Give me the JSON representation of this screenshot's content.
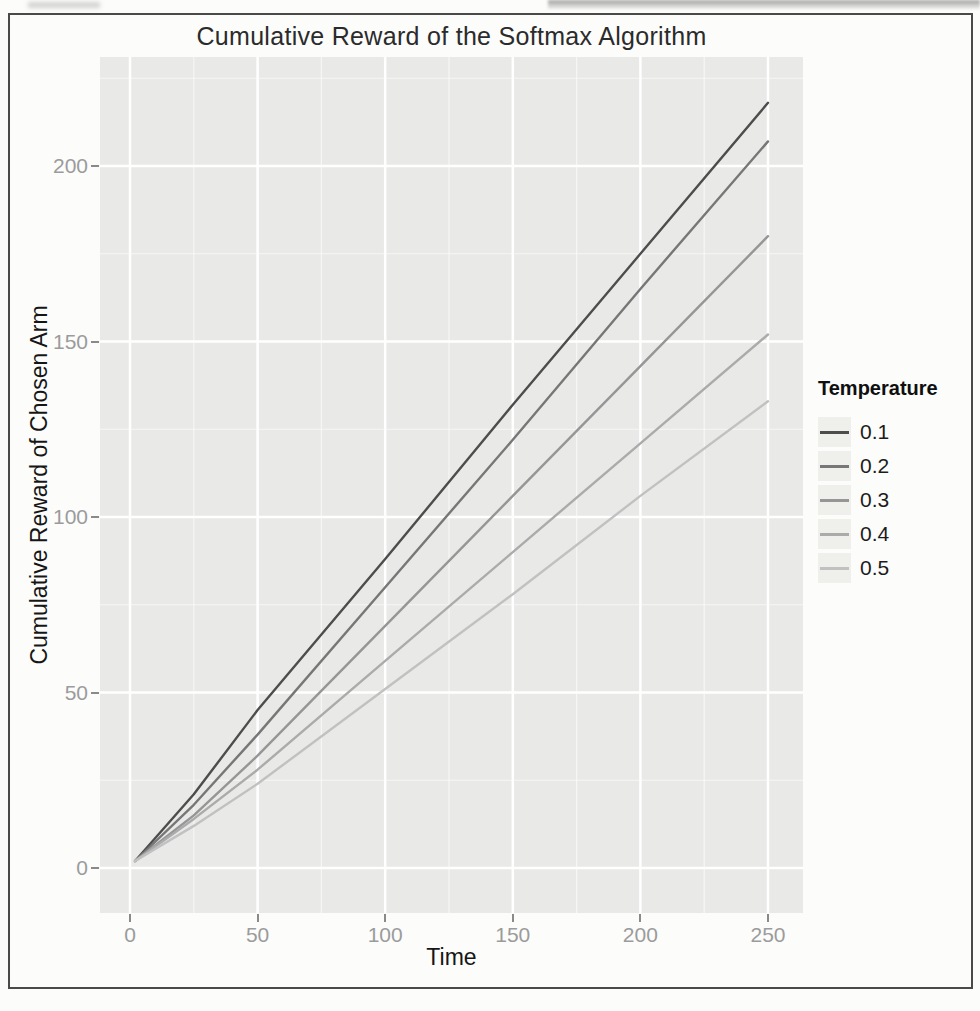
{
  "chart_data": {
    "type": "line",
    "title": "Cumulative Reward of the Softmax Algorithm",
    "xlabel": "Time",
    "ylabel": "Cumulative Reward of Chosen Arm",
    "legend_title": "Temperature",
    "legend_position": "right",
    "xlim": [
      0,
      250
    ],
    "ylim": [
      0,
      200
    ],
    "xticks": [
      0,
      50,
      100,
      150,
      200,
      250
    ],
    "yticks": [
      0,
      50,
      100,
      150,
      200
    ],
    "grid": "major and minor white gridlines on gray panel (ggplot style)",
    "panel_bg": "#e9e9e7",
    "gridline_color": "#ffffff",
    "tick_label_color": "#9b9b9b",
    "series": [
      {
        "name": "0.1",
        "color": "#4d4d4d",
        "points": [
          [
            2,
            2
          ],
          [
            25,
            21
          ],
          [
            50,
            45
          ],
          [
            100,
            88
          ],
          [
            150,
            132
          ],
          [
            200,
            175
          ],
          [
            250,
            218
          ]
        ]
      },
      {
        "name": "0.2",
        "color": "#777777",
        "points": [
          [
            2,
            2
          ],
          [
            25,
            18
          ],
          [
            50,
            38
          ],
          [
            100,
            80
          ],
          [
            150,
            122
          ],
          [
            200,
            165
          ],
          [
            250,
            207
          ]
        ]
      },
      {
        "name": "0.3",
        "color": "#969696",
        "points": [
          [
            2,
            2
          ],
          [
            25,
            15
          ],
          [
            50,
            32
          ],
          [
            100,
            69
          ],
          [
            150,
            106
          ],
          [
            200,
            143
          ],
          [
            250,
            180
          ]
        ]
      },
      {
        "name": "0.4",
        "color": "#ababab",
        "points": [
          [
            2,
            2
          ],
          [
            25,
            14
          ],
          [
            50,
            28
          ],
          [
            100,
            59
          ],
          [
            150,
            90
          ],
          [
            200,
            121
          ],
          [
            250,
            152
          ]
        ]
      },
      {
        "name": "0.5",
        "color": "#c1c1c1",
        "points": [
          [
            2,
            2
          ],
          [
            25,
            12
          ],
          [
            50,
            24
          ],
          [
            100,
            51
          ],
          [
            150,
            78
          ],
          [
            200,
            106
          ],
          [
            250,
            133
          ]
        ]
      }
    ]
  }
}
